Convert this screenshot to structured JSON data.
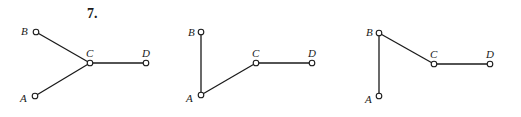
{
  "problem_number": "7.",
  "graphs": [
    {
      "nodes": {
        "A": {
          "label": "A",
          "x": 35,
          "y": 96
        },
        "B": {
          "label": "B",
          "x": 36,
          "y": 32
        },
        "C": {
          "label": "C",
          "x": 90,
          "y": 63
        },
        "D": {
          "label": "D",
          "x": 146,
          "y": 63
        }
      },
      "edges": [
        [
          "B",
          "C"
        ],
        [
          "A",
          "C"
        ],
        [
          "C",
          "D"
        ]
      ]
    },
    {
      "nodes": {
        "A": {
          "label": "A",
          "x": 201,
          "y": 95
        },
        "B": {
          "label": "B",
          "x": 201,
          "y": 32
        },
        "C": {
          "label": "C",
          "x": 256,
          "y": 63
        },
        "D": {
          "label": "D",
          "x": 312,
          "y": 63
        }
      },
      "edges": [
        [
          "B",
          "A"
        ],
        [
          "A",
          "C"
        ],
        [
          "C",
          "D"
        ]
      ]
    },
    {
      "nodes": {
        "A": {
          "label": "A",
          "x": 379,
          "y": 96
        },
        "B": {
          "label": "B",
          "x": 379,
          "y": 33
        },
        "C": {
          "label": "C",
          "x": 434,
          "y": 64
        },
        "D": {
          "label": "D",
          "x": 490,
          "y": 64
        }
      },
      "edges": [
        [
          "B",
          "A"
        ],
        [
          "B",
          "C"
        ],
        [
          "C",
          "D"
        ]
      ]
    }
  ]
}
